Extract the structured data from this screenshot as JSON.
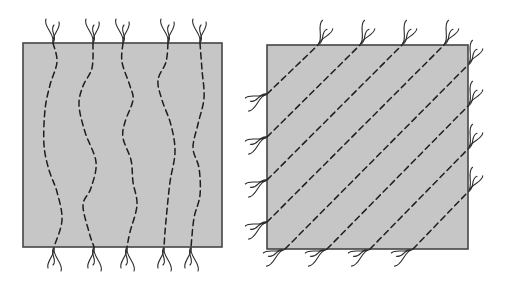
{
  "figure": {
    "width": 507,
    "height": 291,
    "colors": {
      "background": "#ffffff",
      "panel_fill": "#c6c6c6",
      "panel_border": "#454545",
      "fiber": "#1e1e1e",
      "tuft": "#2a2a2a"
    },
    "dash_pattern": "6 4",
    "panels": [
      {
        "id": "left",
        "description": "Square sample with five wavy, roughly vertical dashed fibers; frayed fiber ends protrude above and below",
        "rect": {
          "x": 23,
          "y": 43,
          "w": 199,
          "h": 204
        },
        "fiber_orientation": "vertical-wavy",
        "fibers": [
          {
            "points": [
              [
                53,
                43
              ],
              [
                57,
                62
              ],
              [
                50,
                85
              ],
              [
                45,
                110
              ],
              [
                44,
                145
              ],
              [
                49,
                170
              ],
              [
                57,
                192
              ],
              [
                62,
                220
              ],
              [
                54,
                247
              ]
            ]
          },
          {
            "points": [
              [
                93,
                43
              ],
              [
                92,
                68
              ],
              [
                83,
                86
              ],
              [
                79,
                105
              ],
              [
                85,
                132
              ],
              [
                96,
                162
              ],
              [
                91,
                188
              ],
              [
                83,
                205
              ],
              [
                89,
                232
              ],
              [
                94,
                247
              ]
            ]
          },
          {
            "points": [
              [
                123,
                43
              ],
              [
                122,
                62
              ],
              [
                130,
                86
              ],
              [
                133,
                100
              ],
              [
                125,
                122
              ],
              [
                123,
                138
              ],
              [
                131,
                160
              ],
              [
                133,
                182
              ],
              [
                137,
                205
              ],
              [
                130,
                232
              ],
              [
                127,
                247
              ]
            ]
          },
          {
            "points": [
              [
                168,
                43
              ],
              [
                166,
                62
              ],
              [
                158,
                80
              ],
              [
                162,
                100
              ],
              [
                171,
                125
              ],
              [
                175,
                152
              ],
              [
                170,
                182
              ],
              [
                167,
                210
              ],
              [
                165,
                232
              ],
              [
                164,
                247
              ]
            ]
          },
          {
            "points": [
              [
                200,
                43
              ],
              [
                202,
                70
              ],
              [
                204,
                98
              ],
              [
                198,
                124
              ],
              [
                193,
                148
              ],
              [
                199,
                168
              ],
              [
                200,
                195
              ],
              [
                194,
                218
              ],
              [
                191,
                247
              ]
            ]
          }
        ],
        "tufts": [
          {
            "at": [
              53,
              43
            ],
            "dir": "up"
          },
          {
            "at": [
              93,
              43
            ],
            "dir": "up"
          },
          {
            "at": [
              123,
              43
            ],
            "dir": "up"
          },
          {
            "at": [
              168,
              43
            ],
            "dir": "up"
          },
          {
            "at": [
              200,
              43
            ],
            "dir": "up"
          },
          {
            "at": [
              54,
              247
            ],
            "dir": "down"
          },
          {
            "at": [
              94,
              247
            ],
            "dir": "down"
          },
          {
            "at": [
              127,
              247
            ],
            "dir": "down"
          },
          {
            "at": [
              164,
              247
            ],
            "dir": "down"
          },
          {
            "at": [
              191,
              247
            ],
            "dir": "down"
          }
        ]
      },
      {
        "id": "right",
        "description": "Square sample with eight straight parallel dashed fibers at 45 degrees; frayed fiber ends protrude from all four edges",
        "rect": {
          "x": 267,
          "y": 45,
          "w": 201,
          "h": 204
        },
        "fiber_orientation": "diagonal-45",
        "fibers": [
          {
            "points": [
              [
                267,
                94
              ],
              [
                318,
                45
              ]
            ]
          },
          {
            "points": [
              [
                267,
                137
              ],
              [
                360,
                45
              ]
            ]
          },
          {
            "points": [
              [
                267,
                180
              ],
              [
                402,
                45
              ]
            ]
          },
          {
            "points": [
              [
                267,
                222
              ],
              [
                444,
                45
              ]
            ]
          },
          {
            "points": [
              [
                285,
                249
              ],
              [
                468,
                65
              ]
            ]
          },
          {
            "points": [
              [
                327,
                249
              ],
              [
                468,
                106
              ]
            ]
          },
          {
            "points": [
              [
                370,
                249
              ],
              [
                468,
                149
              ]
            ]
          },
          {
            "points": [
              [
                413,
                249
              ],
              [
                468,
                192
              ]
            ]
          }
        ],
        "tufts": [
          {
            "at": [
              318,
              45
            ],
            "dir": "up-right"
          },
          {
            "at": [
              360,
              45
            ],
            "dir": "up-right"
          },
          {
            "at": [
              402,
              45
            ],
            "dir": "up-right"
          },
          {
            "at": [
              444,
              45
            ],
            "dir": "up-right"
          },
          {
            "at": [
              468,
              65
            ],
            "dir": "up-right"
          },
          {
            "at": [
              468,
              106
            ],
            "dir": "up-right"
          },
          {
            "at": [
              468,
              149
            ],
            "dir": "up-right"
          },
          {
            "at": [
              468,
              192
            ],
            "dir": "up-right"
          },
          {
            "at": [
              267,
              94
            ],
            "dir": "down-left"
          },
          {
            "at": [
              267,
              137
            ],
            "dir": "down-left"
          },
          {
            "at": [
              267,
              180
            ],
            "dir": "down-left"
          },
          {
            "at": [
              267,
              222
            ],
            "dir": "down-left"
          },
          {
            "at": [
              285,
              249
            ],
            "dir": "down-left"
          },
          {
            "at": [
              327,
              249
            ],
            "dir": "down-left"
          },
          {
            "at": [
              370,
              249
            ],
            "dir": "down-left"
          },
          {
            "at": [
              413,
              249
            ],
            "dir": "down-left"
          }
        ]
      }
    ]
  }
}
